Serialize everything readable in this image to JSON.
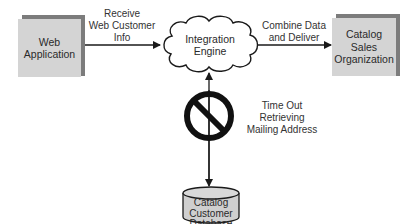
{
  "diagram": {
    "nodes": {
      "web_application": {
        "label": "Web\nApplication",
        "shape": "shadowed-box"
      },
      "integration_engine": {
        "label": "Integration\nEngine",
        "shape": "cloud"
      },
      "catalog_sales": {
        "label": "Catalog\nSales\nOrganization",
        "shape": "shadowed-box"
      },
      "catalog_db": {
        "label": "Catalog\nCustomer\nDatabase",
        "shape": "cylinder"
      }
    },
    "edges": {
      "receive": {
        "label": "Receive\nWeb Customer\nInfo",
        "from": "web_application",
        "to": "integration_engine"
      },
      "combine": {
        "label": "Combine Data\nand Deliver",
        "from": "integration_engine",
        "to": "catalog_sales"
      },
      "timeout": {
        "label": "Time Out\nRetrieving\nMailing Address",
        "from": "catalog_db",
        "to": "integration_engine",
        "blocked": true,
        "icon": "no-entry-icon"
      }
    },
    "colors": {
      "box_fill": "#d4d4d4",
      "box_shadow": "#7c7c7c",
      "cylinder_fill": "#cfcfcf",
      "line": "#1a1a1a",
      "no_entry": "#111111"
    }
  }
}
